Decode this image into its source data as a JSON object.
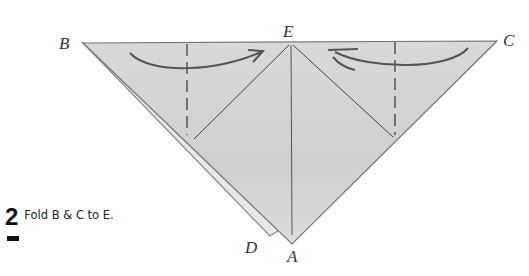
{
  "step": {
    "number": "2",
    "instruction": "Fold B & C to E."
  },
  "diagram": {
    "labels": {
      "B": "B",
      "C": "C",
      "E": "E",
      "A": "A",
      "D": "D"
    },
    "colors": {
      "paper": "#d4d4d4",
      "paper_light": "#e6e6e6",
      "line": "#555555",
      "text": "#333333"
    }
  }
}
